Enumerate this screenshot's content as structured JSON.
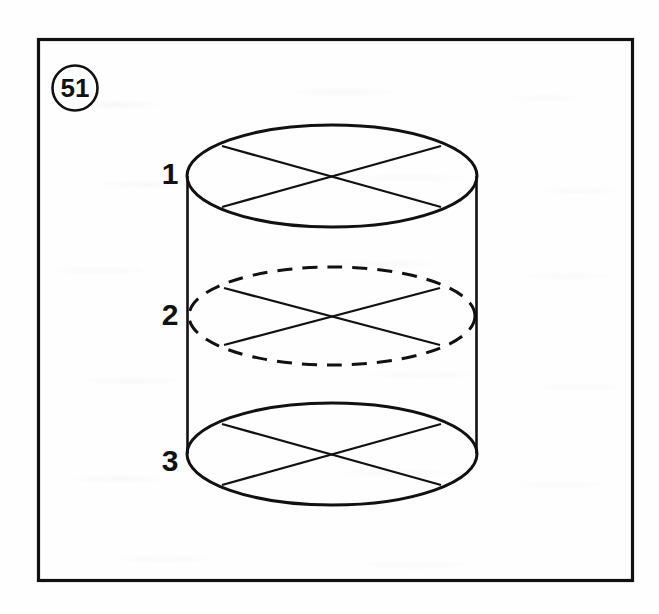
{
  "figure": {
    "number_badge": "51",
    "badge_shape": "circle",
    "frame": {
      "border_color": "#111111",
      "fill": "#ffffff"
    },
    "background_color": "#fefefe",
    "ink_color": "#111111",
    "caption": "",
    "object": "cylinder",
    "object_description": "Right circular cylinder with three labelled horizontal cross-section planes, each drawn as an ellipse with two crossing chords forming an X",
    "cross_sections": [
      {
        "label": "1",
        "position": "top",
        "line_style": "solid",
        "visible": true,
        "center": {
          "x": 332,
          "y": 176
        },
        "radius_x": 145,
        "radius_y": 51,
        "chords": [
          {
            "from": {
              "x": 222,
              "y": 146
            },
            "to": {
              "x": 441,
              "y": 207
            }
          },
          {
            "from": {
              "x": 222,
              "y": 207
            },
            "to": {
              "x": 441,
              "y": 146
            }
          }
        ]
      },
      {
        "label": "2",
        "position": "middle",
        "line_style": "dashed",
        "visible": false,
        "center": {
          "x": 332,
          "y": 316
        },
        "radius_x": 143,
        "radius_y": 49,
        "chords": [
          {
            "from": {
              "x": 224,
              "y": 288
            },
            "to": {
              "x": 440,
              "y": 345
            }
          },
          {
            "from": {
              "x": 224,
              "y": 345
            },
            "to": {
              "x": 440,
              "y": 288
            }
          }
        ]
      },
      {
        "label": "3",
        "position": "bottom",
        "line_style": "solid",
        "visible": true,
        "center": {
          "x": 332,
          "y": 454
        },
        "radius_x": 145,
        "radius_y": 51,
        "chords": [
          {
            "from": {
              "x": 222,
              "y": 424
            },
            "to": {
              "x": 441,
              "y": 485
            }
          },
          {
            "from": {
              "x": 222,
              "y": 485
            },
            "to": {
              "x": 441,
              "y": 424
            }
          }
        ]
      }
    ],
    "cylinder_body": {
      "left_wall_x": 187,
      "right_wall_x": 477,
      "top_y": 176,
      "bottom_y": 454
    },
    "labels": [
      {
        "text": "1",
        "x": 170,
        "y": 184
      },
      {
        "text": "2",
        "x": 170,
        "y": 325
      },
      {
        "text": "3",
        "x": 170,
        "y": 471
      }
    ]
  }
}
